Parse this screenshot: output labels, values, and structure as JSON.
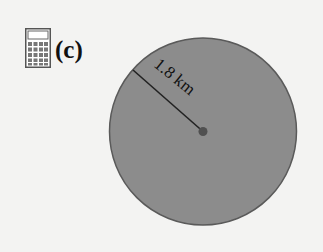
{
  "header": {
    "icon": "calculator-icon",
    "part_label": "(c)"
  },
  "diagram": {
    "shape": "circle",
    "radius_label": "1.8 km",
    "colors": {
      "background": "#f3f3f2",
      "circle_fill": "#8c8c8c",
      "circle_stroke": "#5a5a5a",
      "line": "#222222",
      "center_dot": "#505050"
    }
  }
}
